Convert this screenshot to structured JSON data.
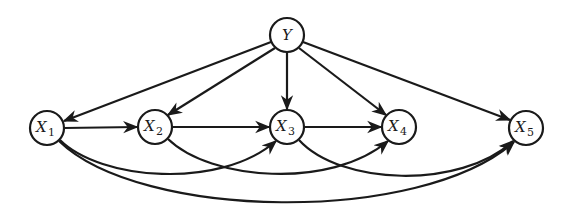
{
  "diagram": {
    "type": "directed-graph",
    "nodes": [
      {
        "id": "Y",
        "label": "Y",
        "sub": "",
        "x": 287,
        "y": 35,
        "r": 17
      },
      {
        "id": "X1",
        "label": "X",
        "sub": "1",
        "x": 47,
        "y": 128,
        "r": 17
      },
      {
        "id": "X2",
        "label": "X",
        "sub": "2",
        "x": 155,
        "y": 127,
        "r": 17
      },
      {
        "id": "X3",
        "label": "X",
        "sub": "3",
        "x": 287,
        "y": 127,
        "r": 17
      },
      {
        "id": "X4",
        "label": "X",
        "sub": "4",
        "x": 399,
        "y": 127,
        "r": 17
      },
      {
        "id": "X5",
        "label": "X",
        "sub": "5",
        "x": 526,
        "y": 128,
        "r": 17
      }
    ],
    "edges": [
      {
        "from": "Y",
        "to": "X1",
        "style": "straight"
      },
      {
        "from": "Y",
        "to": "X2",
        "style": "straight"
      },
      {
        "from": "Y",
        "to": "X3",
        "style": "straight"
      },
      {
        "from": "Y",
        "to": "X4",
        "style": "straight"
      },
      {
        "from": "Y",
        "to": "X5",
        "style": "straight"
      },
      {
        "from": "X1",
        "to": "X2",
        "style": "straight"
      },
      {
        "from": "X2",
        "to": "X3",
        "style": "straight"
      },
      {
        "from": "X3",
        "to": "X4",
        "style": "straight"
      },
      {
        "from": "X1",
        "to": "X3",
        "style": "curved-below"
      },
      {
        "from": "X2",
        "to": "X4",
        "style": "curved-below"
      },
      {
        "from": "X3",
        "to": "X5",
        "style": "curved-below"
      },
      {
        "from": "X1",
        "to": "X5",
        "style": "curved-below"
      }
    ],
    "colors": {
      "stroke": "#1a1a1a",
      "background": "#ffffff"
    }
  }
}
